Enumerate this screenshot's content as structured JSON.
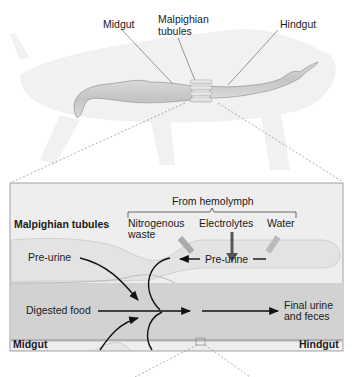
{
  "top_labels": {
    "midgut": "Midgut",
    "malpighian_line1": "Malpighian",
    "malpighian_line2": "tubules",
    "hindgut": "Hindgut"
  },
  "detail_panel": {
    "from_hemolymph": "From hemolymph",
    "malpighian_tubules": "Malpighian tubules",
    "nitrogenous_line1": "Nitrogenous",
    "nitrogenous_line2": "waste",
    "electrolytes": "Electrolytes",
    "water": "Water",
    "pre_urine_left": "Pre-urine",
    "pre_urine_right": "Pre-urine",
    "digested_food": "Digested food",
    "final_line1": "Final urine",
    "final_line2": "and feces",
    "midgut": "Midgut",
    "hindgut": "Hindgut"
  },
  "colors": {
    "panel_bg": "#ededed",
    "panel_border": "#8a8a8a",
    "gut": "#cfcfcf",
    "tubule": "#e4e4e4",
    "silhouette": "#f0f0f0",
    "arrow": "#111111",
    "electrolyte_arrow": "#555555"
  }
}
